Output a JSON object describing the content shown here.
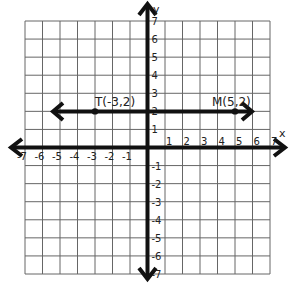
{
  "diagram": {
    "type": "coordinate-plane",
    "x_axis": {
      "label": "x",
      "min": -7,
      "max": 7,
      "ticks": [
        "-7",
        "-6",
        "-5",
        "-4",
        "-3",
        "-2",
        "-1",
        "1",
        "2",
        "3",
        "4",
        "5",
        "6",
        "7"
      ]
    },
    "y_axis": {
      "label": "y",
      "min": -7,
      "max": 7,
      "ticks": [
        "7",
        "6",
        "5",
        "4",
        "3",
        "2",
        "1",
        "-1",
        "-2",
        "-3",
        "-4",
        "-5",
        "-6",
        "-7"
      ]
    },
    "line": {
      "description": "horizontal line y = 2 with arrows both ends",
      "y": 2,
      "x_from": -5.5,
      "x_to": 6
    },
    "points": [
      {
        "name": "T",
        "label": "T(-3,2)",
        "x": -3,
        "y": 2
      },
      {
        "name": "M",
        "label": "M(5,2)",
        "x": 5,
        "y": 2
      }
    ],
    "colors": {
      "grid": "#555555",
      "axis": "#111111",
      "line": "#111111"
    }
  }
}
